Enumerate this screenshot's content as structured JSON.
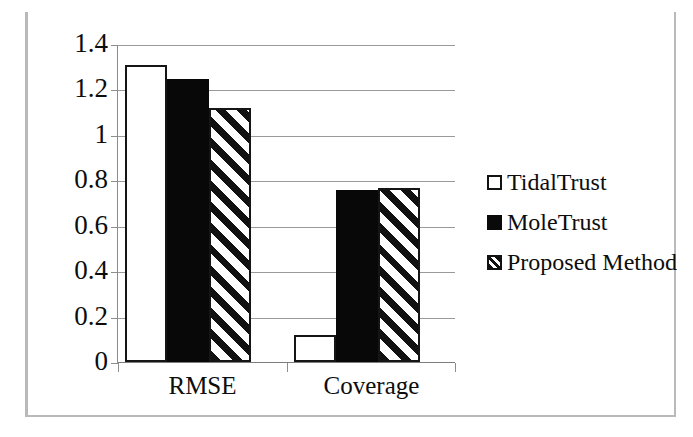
{
  "chart_data": {
    "type": "bar",
    "title": "",
    "xlabel": "",
    "ylabel": "",
    "categories": [
      "RMSE",
      "Coverage"
    ],
    "series": [
      {
        "name": "TidalTrust",
        "values": [
          1.31,
          0.12
        ],
        "style": "open-white"
      },
      {
        "name": "MoleTrust",
        "values": [
          1.25,
          0.76
        ],
        "style": "solid-black"
      },
      {
        "name": "Proposed Method",
        "values": [
          1.12,
          0.77
        ],
        "style": "diagonal-hatch"
      }
    ],
    "ylim": [
      0,
      1.4
    ],
    "ytick_step": 0.2,
    "yticks": [
      "1.4",
      "1.2",
      "1",
      "0.8",
      "0.6",
      "0.4",
      "0.2",
      "0"
    ],
    "ytick_values": [
      1.4,
      1.2,
      1.0,
      0.8,
      0.6,
      0.4,
      0.2,
      0
    ],
    "grid": true,
    "grid_axis": "y",
    "legend_position": "right",
    "colors": {
      "series_tidaltrust": "#ffffff",
      "series_moletrust": "#080808",
      "series_proposed": "#ffffff",
      "outline": "#151515",
      "gridline": "#9a9a9a",
      "axis": "#8d8d8d",
      "frame": "#b9b9b9",
      "text": "#0d0d0d"
    }
  },
  "legend": {
    "items": [
      {
        "label": "TidalTrust"
      },
      {
        "label": "MoleTrust"
      },
      {
        "label": "Proposed Method"
      }
    ]
  }
}
